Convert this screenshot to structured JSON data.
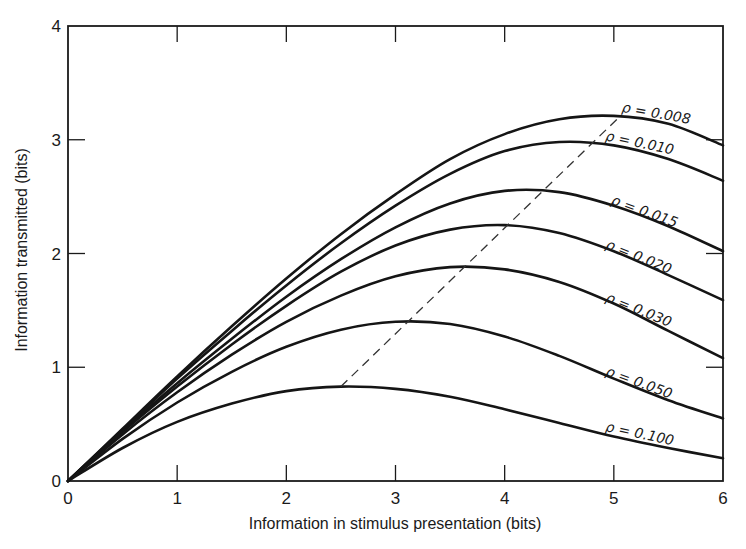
{
  "chart_data": {
    "type": "line",
    "title": "",
    "xlabel": "Information in stimulus presentation (bits)",
    "ylabel": "Information transmitted (bits)",
    "xlim": [
      0,
      6
    ],
    "ylim": [
      0,
      4
    ],
    "xticks": [
      0,
      1,
      2,
      3,
      4,
      5,
      6
    ],
    "yticks": [
      0,
      1,
      2,
      3,
      4
    ],
    "grid": false,
    "legend_position": "inline labels at right end of each curve",
    "series": [
      {
        "name": "ρ = 0.008",
        "label": "ρ = 0.008",
        "x": [
          0,
          0.5,
          1,
          1.5,
          2,
          2.5,
          3,
          3.5,
          4,
          4.5,
          5,
          5.5,
          6
        ],
        "y": [
          0,
          0.46,
          0.92,
          1.36,
          1.78,
          2.17,
          2.52,
          2.83,
          3.05,
          3.18,
          3.21,
          3.14,
          2.95
        ]
      },
      {
        "name": "ρ = 0.010",
        "label": "ρ = 0.010",
        "x": [
          0,
          0.5,
          1,
          1.5,
          2,
          2.5,
          3,
          3.5,
          4,
          4.5,
          5,
          5.5,
          6
        ],
        "y": [
          0,
          0.45,
          0.9,
          1.32,
          1.72,
          2.09,
          2.42,
          2.7,
          2.9,
          2.98,
          2.95,
          2.83,
          2.64
        ]
      },
      {
        "name": "ρ = 0.015",
        "label": "ρ = 0.015",
        "x": [
          0,
          0.5,
          1,
          1.5,
          2,
          2.5,
          3,
          3.5,
          4,
          4.5,
          5,
          5.5,
          6
        ],
        "y": [
          0,
          0.44,
          0.86,
          1.25,
          1.62,
          1.95,
          2.23,
          2.44,
          2.55,
          2.54,
          2.42,
          2.24,
          2.02
        ]
      },
      {
        "name": "ρ = 0.020",
        "label": "ρ = 0.020",
        "x": [
          0,
          0.5,
          1,
          1.5,
          2,
          2.5,
          3,
          3.5,
          4,
          4.5,
          5,
          5.5,
          6
        ],
        "y": [
          0,
          0.43,
          0.83,
          1.2,
          1.54,
          1.84,
          2.07,
          2.21,
          2.25,
          2.18,
          2.02,
          1.81,
          1.59
        ]
      },
      {
        "name": "ρ = 0.030",
        "label": "ρ = 0.030",
        "x": [
          0,
          0.5,
          1,
          1.5,
          2,
          2.5,
          3,
          3.5,
          4,
          4.5,
          5,
          5.5,
          6
        ],
        "y": [
          0,
          0.41,
          0.78,
          1.11,
          1.4,
          1.63,
          1.8,
          1.88,
          1.86,
          1.75,
          1.56,
          1.32,
          1.08
        ]
      },
      {
        "name": "ρ = 0.050",
        "label": "ρ = 0.050",
        "x": [
          0,
          0.5,
          1,
          1.5,
          2,
          2.5,
          3,
          3.5,
          4,
          4.5,
          5,
          5.5,
          6
        ],
        "y": [
          0,
          0.37,
          0.69,
          0.96,
          1.18,
          1.33,
          1.4,
          1.38,
          1.27,
          1.1,
          0.9,
          0.71,
          0.55
        ]
      },
      {
        "name": "ρ = 0.100",
        "label": "ρ = 0.100",
        "x": [
          0,
          0.5,
          1,
          1.5,
          2,
          2.5,
          3,
          3.5,
          4,
          4.5,
          5,
          5.5,
          6
        ],
        "y": [
          0,
          0.29,
          0.52,
          0.68,
          0.79,
          0.83,
          0.81,
          0.74,
          0.63,
          0.51,
          0.39,
          0.29,
          0.2
        ]
      }
    ],
    "annotations": [
      {
        "type": "dashed-line",
        "description": "locus of curve maxima",
        "from": [
          2.5,
          0.83
        ],
        "to": [
          5.05,
          3.2
        ]
      }
    ]
  },
  "axes": {
    "x_title": "Information in stimulus presentation (bits)",
    "y_title": "Information transmitted (bits)",
    "x_tick_labels": [
      "0",
      "1",
      "2",
      "3",
      "4",
      "5",
      "6"
    ],
    "y_tick_labels": [
      "0",
      "1",
      "2",
      "3",
      "4"
    ]
  },
  "colors": {
    "ink": "#151515",
    "background": "#ffffff"
  }
}
